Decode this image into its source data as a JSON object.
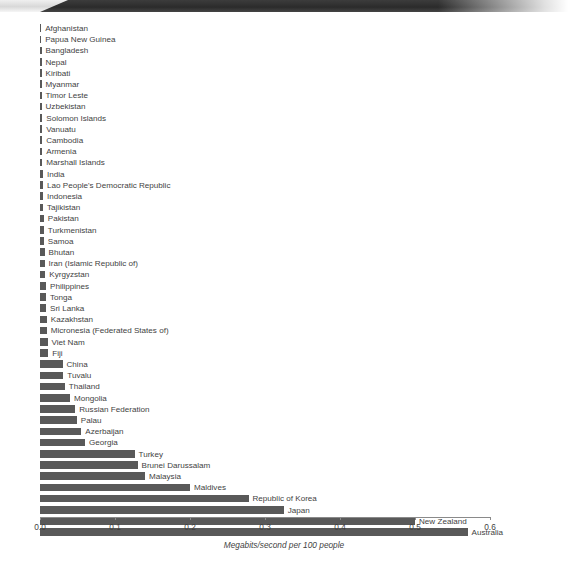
{
  "banner": {
    "name": "header-banner"
  },
  "chart_data": {
    "type": "bar",
    "orientation": "horizontal",
    "title": "",
    "subtitle": "",
    "xlabel": "Megabits/second per 100 people",
    "ylabel": "",
    "xlim": [
      0.0,
      0.6
    ],
    "grid": false,
    "legend": null,
    "bar_color": "#595959",
    "xticks": [
      "0.0",
      "0.1",
      "0.2",
      "0.3",
      "0.4",
      "0.5",
      "0.6"
    ],
    "xtick_values": [
      0.0,
      0.1,
      0.2,
      0.3,
      0.4,
      0.5,
      0.6
    ],
    "categories": [
      "Afghanistan",
      "Papua New Guinea",
      "Bangladesh",
      "Nepal",
      "Kiribati",
      "Myanmar",
      "Timor Leste",
      "Uzbekistan",
      "Solomon Islands",
      "Vanuatu",
      "Cambodia",
      "Armenia",
      "Marshall Islands",
      "India",
      "Lao People's Democratic Republic",
      "Indonesia",
      "Tajikistan",
      "Pakistan",
      "Turkmenistan",
      "Samoa",
      "Bhutan",
      "Iran (Islamic Republic of)",
      "Kyrgyzstan",
      "Philippines",
      "Tonga",
      "Sri Lanka",
      "Kazakhstan",
      "Micronesia (Federated States of)",
      "Viet Nam",
      "Fiji",
      "China",
      "Tuvalu",
      "Thailand",
      "Mongolia",
      "Russian Federation",
      "Palau",
      "Azerbaijan",
      "Georgia",
      "Turkey",
      "Brunei Darussalam",
      "Malaysia",
      "Maldives",
      "Republic of Korea",
      "Japan",
      "New Zealand",
      "Australia"
    ],
    "values": [
      0.001,
      0.001,
      0.002,
      0.002,
      0.002,
      0.002,
      0.002,
      0.002,
      0.003,
      0.003,
      0.003,
      0.003,
      0.003,
      0.004,
      0.004,
      0.004,
      0.004,
      0.005,
      0.005,
      0.005,
      0.006,
      0.006,
      0.007,
      0.008,
      0.008,
      0.008,
      0.009,
      0.009,
      0.01,
      0.011,
      0.03,
      0.031,
      0.033,
      0.04,
      0.047,
      0.049,
      0.055,
      0.06,
      0.126,
      0.13,
      0.14,
      0.2,
      0.278,
      0.325,
      0.5,
      0.57
    ]
  }
}
